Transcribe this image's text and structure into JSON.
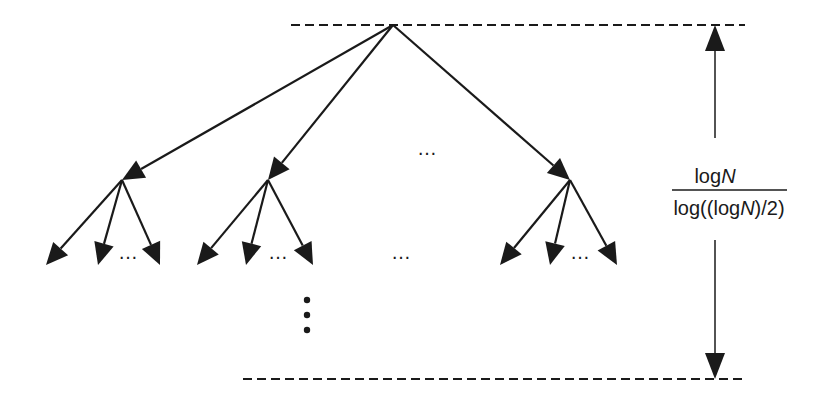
{
  "diagram": {
    "type": "tree-depth",
    "colors": {
      "stroke": "#1a1a1a",
      "background": "#ffffff"
    },
    "height_label": {
      "numerator": "logN",
      "numerator_parts": {
        "fn": "log",
        "var": "N"
      },
      "denominator": "log((logN)/2)",
      "denominator_parts": {
        "pre": "log((log",
        "var": "N",
        "post": ")/2)"
      }
    },
    "ellipsis": "…",
    "root": {
      "x": 393,
      "y": 25
    },
    "children": [
      {
        "id": "child-left",
        "x": 122,
        "y": 180,
        "leaves": [
          {
            "x": 46,
            "y": 265
          },
          {
            "x": 98,
            "y": 265
          },
          {
            "x": 160,
            "y": 265
          }
        ],
        "leaf_ellipsis": {
          "x": 128,
          "y": 259
        }
      },
      {
        "id": "child-middle",
        "x": 268,
        "y": 180,
        "leaves": [
          {
            "x": 197,
            "y": 265
          },
          {
            "x": 246,
            "y": 265
          },
          {
            "x": 313,
            "y": 265
          }
        ],
        "leaf_ellipsis": {
          "x": 278,
          "y": 259
        }
      },
      {
        "id": "child-right",
        "x": 570,
        "y": 180,
        "leaves": [
          {
            "x": 500,
            "y": 265
          },
          {
            "x": 550,
            "y": 265
          },
          {
            "x": 617,
            "y": 265
          }
        ],
        "leaf_ellipsis": {
          "x": 580,
          "y": 259
        }
      }
    ],
    "child_ellipsis": {
      "x": 427,
      "y": 155
    },
    "leaf_row_ellipsis": {
      "x": 401,
      "y": 259
    },
    "vertical_dots": {
      "x": 307,
      "ys": [
        300,
        315,
        330
      ]
    },
    "top_line": {
      "x1": 291,
      "x2": 745,
      "y": 25
    },
    "bottom_line": {
      "x1": 243,
      "x2": 745,
      "y": 379
    },
    "height_arrow": {
      "x": 715,
      "top": 25,
      "bottom": 379,
      "gap_top": 138,
      "gap_bottom": 240
    }
  }
}
